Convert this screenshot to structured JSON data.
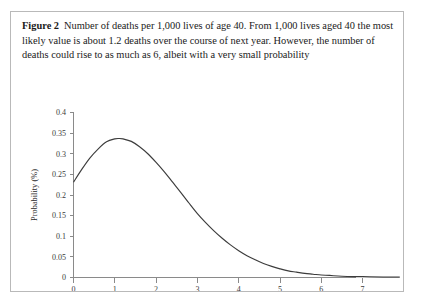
{
  "figure": {
    "label": "Figure 2",
    "title": "Number of deaths per 1,000 lives of age 40.",
    "description": "From 1,000 lives aged 40 the most likely value is about 1.2 deaths over the course of next year. However, the number of deaths could rise to as much as 6, albeit with a very small probability",
    "border_color": "#b9b9b9",
    "background_color": "#ffffff"
  },
  "chart_data": {
    "type": "line",
    "title": "",
    "xlabel": "Number of deaths",
    "ylabel": "Probability (%)",
    "xlim": [
      0,
      7.9
    ],
    "ylim": [
      0,
      0.4
    ],
    "grid": false,
    "legend": false,
    "line_color": "#3c3c3c",
    "axis_color": "#8a8a8a",
    "xticks": [
      "0",
      "1",
      "2",
      "3",
      "4",
      "5",
      "6",
      "7"
    ],
    "xtick_values": [
      0,
      1,
      2,
      3,
      4,
      5,
      6,
      7
    ],
    "yticks": [
      "0",
      "0.05",
      "0.1",
      "0.15",
      "0.2",
      "0.25",
      "0.3",
      "0.35",
      "0.4"
    ],
    "ytick_values": [
      0,
      0.05,
      0.1,
      0.15,
      0.2,
      0.25,
      0.3,
      0.35,
      0.4
    ],
    "peak": {
      "x": 1.1,
      "y": 0.337
    },
    "x": [
      0.0,
      0.2,
      0.4,
      0.6,
      0.8,
      1.0,
      1.1,
      1.2,
      1.4,
      1.6,
      1.8,
      2.0,
      2.2,
      2.4,
      2.6,
      2.8,
      3.0,
      3.2,
      3.4,
      3.6,
      3.8,
      4.0,
      4.2,
      4.4,
      4.6,
      4.8,
      5.0,
      5.2,
      5.4,
      5.6,
      5.8,
      6.0,
      6.2,
      6.5,
      7.0,
      7.5,
      7.9
    ],
    "y": [
      0.231,
      0.262,
      0.29,
      0.312,
      0.329,
      0.336,
      0.337,
      0.336,
      0.33,
      0.317,
      0.3,
      0.279,
      0.256,
      0.231,
      0.206,
      0.18,
      0.155,
      0.133,
      0.113,
      0.095,
      0.079,
      0.065,
      0.053,
      0.043,
      0.034,
      0.027,
      0.021,
      0.016,
      0.013,
      0.01,
      0.008,
      0.006,
      0.005,
      0.003,
      0.002,
      0.001,
      0.001
    ]
  }
}
